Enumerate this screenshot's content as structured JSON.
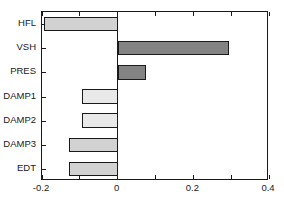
{
  "chart_data": {
    "type": "bar",
    "orientation": "horizontal",
    "title": "",
    "xlabel": "",
    "ylabel": "",
    "categories": [
      "HFL",
      "VSH",
      "PRES",
      "DAMP1",
      "DAMP2",
      "DAMP3",
      "EDT"
    ],
    "values": [
      -0.195,
      0.295,
      0.075,
      -0.095,
      -0.095,
      -0.128,
      -0.128
    ],
    "bar_colors": [
      "#d2d2d2",
      "#838383",
      "#838383",
      "#e9e9e9",
      "#e9e9e9",
      "#d2d2d2",
      "#d2d2d2"
    ],
    "bar_edge_color": "#1a1a1a",
    "xlim": [
      -0.2,
      0.4
    ],
    "xticks": [
      -0.2,
      0,
      0.2,
      0.4
    ],
    "xticklabels": [
      "-0.2",
      "0",
      "0.2",
      "0.4"
    ],
    "xminorticks": [
      -0.1,
      0.1,
      0.3
    ],
    "grid": false,
    "legend": null,
    "zero_line": 0
  },
  "axes": {
    "frame_color": "#1a1a1a",
    "background": "#ffffff"
  }
}
